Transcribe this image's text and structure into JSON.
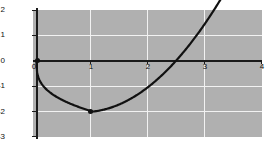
{
  "chart_data": {
    "type": "line",
    "title": "",
    "subtitle": "",
    "xlabel": "",
    "ylabel": "",
    "xlim": [
      -0.06,
      4.0
    ],
    "ylim": [
      -3,
      2
    ],
    "grid": true,
    "legend": null,
    "background_color": "#b0b0b0",
    "grid_color": "#f2f2f2",
    "axis_color": "#1a1a1a",
    "curve_color": "#111111",
    "xticks": [
      0,
      1,
      2,
      3,
      4
    ],
    "xtick_labels": [
      "0",
      "1",
      "2",
      "3",
      "4"
    ],
    "yticks": [
      2,
      1,
      0,
      -1,
      -2,
      -3
    ],
    "ytick_labels": [
      "2",
      "1",
      "0",
      "-1",
      "-2",
      "-3"
    ],
    "series": [
      {
        "name": "curve",
        "x": [
          0.0,
          0.02,
          0.05,
          0.1,
          0.15,
          0.2,
          0.3,
          0.4,
          0.5,
          0.6,
          0.7,
          0.8,
          0.9,
          1.0,
          1.2,
          1.4,
          1.6,
          1.8,
          2.0,
          2.2,
          2.4,
          2.6,
          2.8,
          3.0,
          3.2,
          3.4,
          3.6,
          3.8,
          4.0
        ],
        "y": [
          0.0,
          -0.19,
          -0.31,
          -0.45,
          -0.55,
          -0.63,
          -0.75,
          -0.85,
          -0.91,
          -0.96,
          -0.99,
          -1.0,
          -1.0,
          -2.0,
          -1.96,
          -1.9,
          -1.81,
          -1.7,
          -1.57,
          -1.41,
          -1.23,
          -1.02,
          -0.79,
          0.0,
          0.4,
          0.82,
          1.19,
          1.59,
          2.0
        ]
      }
    ],
    "annotated_points": [
      {
        "name": "origin-point",
        "x": 0,
        "y": 0,
        "label": ""
      },
      {
        "name": "minimum-point",
        "x": 1,
        "y": -2,
        "label": ""
      }
    ]
  },
  "axis": {
    "x_labels": [
      "0",
      "1",
      "2",
      "3",
      "4"
    ],
    "y_labels": [
      "2",
      "1",
      "0",
      "-1",
      "-2",
      "-3"
    ]
  }
}
